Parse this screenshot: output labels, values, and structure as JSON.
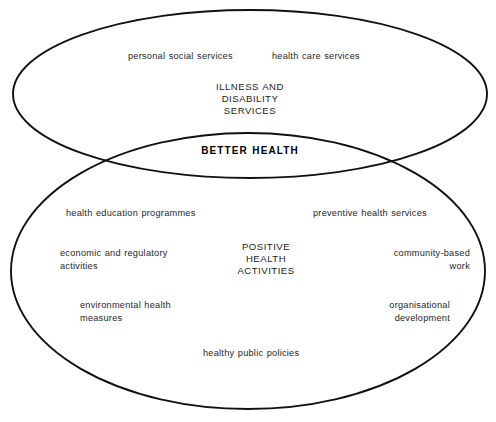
{
  "diagram": {
    "type": "venn-two-ellipse",
    "background_color": "#ffffff",
    "stroke_color": "#111111",
    "upper_region": {
      "title": "ILLNESS AND\nDISABILITY\nSERVICES",
      "items": [
        "personal social services",
        "health care services"
      ]
    },
    "overlap_region": {
      "title": "BETTER HEALTH"
    },
    "lower_region": {
      "title": "POSITIVE\nHEALTH\nACTIVITIES",
      "items": [
        "health education programmes",
        "preventive health services",
        "economic and regulatory\nactivities",
        "community-based\nwork",
        "environmental health\nmeasures",
        "organisational\ndevelopment",
        "healthy public policies"
      ]
    }
  }
}
